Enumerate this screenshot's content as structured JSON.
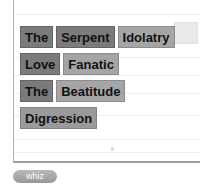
{
  "colors": {
    "tile_dark_bg": "#7b7b7b",
    "tile_light_bg": "#a5a5a5",
    "tile_medium_bg": "#9a9a9a",
    "tile_text": "#111111",
    "panel_border": "#aeaeae",
    "panel_bottom_border": "#9e9e9e",
    "rule_line": "#ededed",
    "button_bg": "#a6a6a6",
    "button_text": "#ffffff"
  },
  "word_rows": [
    {
      "tiles": [
        {
          "label": "The",
          "shade": "dark"
        },
        {
          "label": "Serpent",
          "shade": "dark"
        },
        {
          "label": "Idolatry",
          "shade": "light"
        }
      ]
    },
    {
      "tiles": [
        {
          "label": "Love",
          "shade": "dark"
        },
        {
          "label": "Fanatic",
          "shade": "light"
        }
      ]
    },
    {
      "tiles": [
        {
          "label": "The",
          "shade": "dark"
        },
        {
          "label": "Beatitude",
          "shade": "light"
        }
      ]
    },
    {
      "tiles": [
        {
          "label": "Digression",
          "shade": "medium"
        }
      ]
    }
  ],
  "action_button": {
    "label": "whiz"
  }
}
